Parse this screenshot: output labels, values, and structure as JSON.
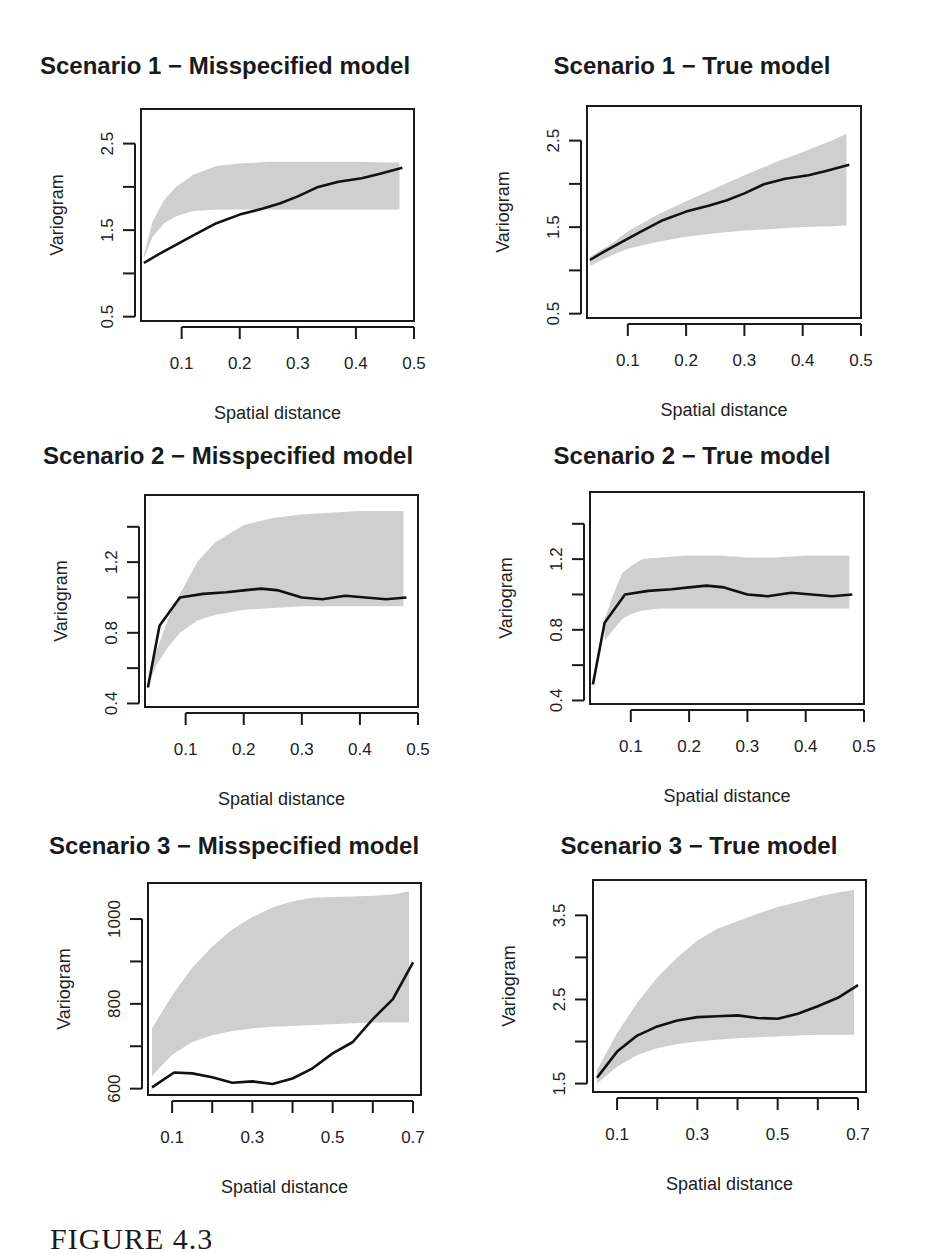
{
  "figure": {
    "caption": "FIGURE 4.3"
  },
  "chart_data": [
    {
      "type": "area",
      "title": "Scenario 1 − Misspecified model",
      "xlabel": "Spatial distance",
      "ylabel": "Variogram",
      "xlim": [
        0.03,
        0.5
      ],
      "ylim": [
        0.45,
        2.9
      ],
      "xticks": [
        0.1,
        0.2,
        0.3,
        0.4,
        0.5
      ],
      "xtick_labels": [
        "0.1",
        "0.2",
        "0.3",
        "0.4",
        "0.5"
      ],
      "yticks": [
        0.5,
        1.0,
        1.5,
        2.0,
        2.5
      ],
      "ytick_labels": [
        "0.5",
        "",
        "1.5",
        "",
        "2.5"
      ],
      "grid": false,
      "series": [
        {
          "name": "empirical variogram",
          "kind": "line",
          "x": [
            0.035,
            0.06,
            0.09,
            0.12,
            0.16,
            0.2,
            0.24,
            0.27,
            0.3,
            0.335,
            0.37,
            0.41,
            0.44,
            0.48
          ],
          "y": [
            1.12,
            1.22,
            1.33,
            1.44,
            1.58,
            1.68,
            1.75,
            1.81,
            1.89,
            2.0,
            2.06,
            2.1,
            2.15,
            2.22
          ]
        },
        {
          "name": "simulation envelope",
          "kind": "band",
          "x": [
            0.035,
            0.05,
            0.07,
            0.09,
            0.12,
            0.16,
            0.2,
            0.25,
            0.3,
            0.35,
            0.4,
            0.45,
            0.475
          ],
          "lower": [
            1.18,
            1.42,
            1.58,
            1.66,
            1.72,
            1.74,
            1.74,
            1.74,
            1.74,
            1.74,
            1.74,
            1.74,
            1.74
          ],
          "upper": [
            1.22,
            1.6,
            1.85,
            2.0,
            2.14,
            2.24,
            2.27,
            2.29,
            2.29,
            2.29,
            2.29,
            2.28,
            2.28
          ]
        }
      ]
    },
    {
      "type": "area",
      "title": "Scenario 1 − True model",
      "xlabel": "Spatial distance",
      "ylabel": "Variogram",
      "xlim": [
        0.03,
        0.5
      ],
      "ylim": [
        0.45,
        2.9
      ],
      "xticks": [
        0.1,
        0.2,
        0.3,
        0.4,
        0.5
      ],
      "xtick_labels": [
        "0.1",
        "0.2",
        "0.3",
        "0.4",
        "0.5"
      ],
      "yticks": [
        0.5,
        1.0,
        1.5,
        2.0,
        2.5
      ],
      "ytick_labels": [
        "0.5",
        "",
        "1.5",
        "",
        "2.5"
      ],
      "grid": false,
      "series": [
        {
          "name": "empirical variogram",
          "kind": "line",
          "x": [
            0.035,
            0.06,
            0.09,
            0.12,
            0.16,
            0.2,
            0.24,
            0.27,
            0.3,
            0.335,
            0.37,
            0.41,
            0.44,
            0.48
          ],
          "y": [
            1.12,
            1.22,
            1.33,
            1.44,
            1.58,
            1.68,
            1.75,
            1.81,
            1.89,
            2.0,
            2.06,
            2.1,
            2.15,
            2.22
          ]
        },
        {
          "name": "simulation envelope",
          "kind": "band",
          "x": [
            0.035,
            0.07,
            0.1,
            0.15,
            0.2,
            0.25,
            0.3,
            0.35,
            0.4,
            0.45,
            0.475
          ],
          "lower": [
            1.05,
            1.17,
            1.25,
            1.33,
            1.39,
            1.43,
            1.46,
            1.48,
            1.5,
            1.51,
            1.52
          ],
          "upper": [
            1.16,
            1.3,
            1.45,
            1.64,
            1.8,
            1.95,
            2.1,
            2.24,
            2.37,
            2.5,
            2.58
          ]
        }
      ]
    },
    {
      "type": "area",
      "title": "Scenario 2 − Misspecified model",
      "xlabel": "Spatial distance",
      "ylabel": "Variogram",
      "xlim": [
        0.03,
        0.5
      ],
      "ylim": [
        0.38,
        1.58
      ],
      "xticks": [
        0.1,
        0.2,
        0.3,
        0.4,
        0.5
      ],
      "xtick_labels": [
        "0.1",
        "0.2",
        "0.3",
        "0.4",
        "0.5"
      ],
      "yticks": [
        0.4,
        0.6,
        0.8,
        1.0,
        1.2,
        1.4
      ],
      "ytick_labels": [
        "0.4",
        "",
        "0.8",
        "",
        "1.2",
        ""
      ],
      "grid": false,
      "series": [
        {
          "name": "empirical variogram",
          "kind": "line",
          "x": [
            0.035,
            0.055,
            0.09,
            0.13,
            0.17,
            0.2,
            0.23,
            0.26,
            0.3,
            0.335,
            0.375,
            0.41,
            0.445,
            0.48
          ],
          "y": [
            0.49,
            0.84,
            1.0,
            1.02,
            1.03,
            1.04,
            1.05,
            1.04,
            1.0,
            0.99,
            1.01,
            1.0,
            0.99,
            1.0
          ]
        },
        {
          "name": "simulation envelope",
          "kind": "band",
          "x": [
            0.035,
            0.05,
            0.07,
            0.09,
            0.12,
            0.15,
            0.2,
            0.25,
            0.3,
            0.35,
            0.4,
            0.45,
            0.475
          ],
          "lower": [
            0.5,
            0.62,
            0.72,
            0.8,
            0.87,
            0.9,
            0.93,
            0.94,
            0.95,
            0.95,
            0.95,
            0.95,
            0.95
          ],
          "upper": [
            0.52,
            0.7,
            0.88,
            1.02,
            1.2,
            1.31,
            1.41,
            1.45,
            1.47,
            1.48,
            1.49,
            1.49,
            1.49
          ]
        }
      ]
    },
    {
      "type": "area",
      "title": "Scenario 2 − True model",
      "xlabel": "Spatial distance",
      "ylabel": "Variogram",
      "xlim": [
        0.03,
        0.5
      ],
      "ylim": [
        0.38,
        1.58
      ],
      "xticks": [
        0.1,
        0.2,
        0.3,
        0.4,
        0.5
      ],
      "xtick_labels": [
        "0.1",
        "0.2",
        "0.3",
        "0.4",
        "0.5"
      ],
      "yticks": [
        0.4,
        0.6,
        0.8,
        1.0,
        1.2,
        1.4
      ],
      "ytick_labels": [
        "0.4",
        "",
        "0.8",
        "",
        "1.2",
        ""
      ],
      "grid": false,
      "series": [
        {
          "name": "empirical variogram",
          "kind": "line",
          "x": [
            0.035,
            0.055,
            0.09,
            0.13,
            0.17,
            0.2,
            0.23,
            0.26,
            0.3,
            0.335,
            0.375,
            0.41,
            0.445,
            0.48
          ],
          "y": [
            0.49,
            0.84,
            1.0,
            1.02,
            1.03,
            1.04,
            1.05,
            1.04,
            1.0,
            0.99,
            1.01,
            1.0,
            0.99,
            1.0
          ]
        },
        {
          "name": "simulation envelope",
          "kind": "band",
          "x": [
            0.055,
            0.07,
            0.085,
            0.1,
            0.12,
            0.15,
            0.2,
            0.25,
            0.3,
            0.35,
            0.4,
            0.45,
            0.475
          ],
          "lower": [
            0.74,
            0.8,
            0.86,
            0.89,
            0.91,
            0.92,
            0.92,
            0.92,
            0.92,
            0.92,
            0.92,
            0.92,
            0.92
          ],
          "upper": [
            0.86,
            1.0,
            1.12,
            1.16,
            1.2,
            1.21,
            1.22,
            1.22,
            1.21,
            1.21,
            1.22,
            1.22,
            1.22
          ]
        }
      ]
    },
    {
      "type": "area",
      "title": "Scenario 3 − Misspecified model",
      "xlabel": "Spatial distance",
      "ylabel": "Variogram",
      "xlim": [
        0.04,
        0.72
      ],
      "ylim": [
        585,
        1085
      ],
      "xticks": [
        0.1,
        0.2,
        0.3,
        0.4,
        0.5,
        0.6,
        0.7
      ],
      "xtick_labels": [
        "0.1",
        "",
        "0.3",
        "",
        "0.5",
        "",
        "0.7"
      ],
      "yticks": [
        600,
        700,
        800,
        900,
        1000
      ],
      "ytick_labels": [
        "600",
        "",
        "800",
        "",
        "1000"
      ],
      "grid": false,
      "series": [
        {
          "name": "empirical variogram",
          "kind": "line",
          "x": [
            0.05,
            0.105,
            0.15,
            0.2,
            0.25,
            0.3,
            0.35,
            0.4,
            0.45,
            0.5,
            0.55,
            0.6,
            0.65,
            0.7
          ],
          "y": [
            603,
            638,
            636,
            627,
            614,
            617,
            611,
            624,
            648,
            683,
            710,
            764,
            811,
            898
          ]
        },
        {
          "name": "simulation envelope",
          "kind": "band",
          "x": [
            0.05,
            0.1,
            0.15,
            0.2,
            0.25,
            0.3,
            0.35,
            0.4,
            0.45,
            0.5,
            0.55,
            0.6,
            0.65,
            0.69
          ],
          "lower": [
            630,
            680,
            710,
            726,
            736,
            742,
            746,
            748,
            750,
            752,
            754,
            756,
            756,
            756
          ],
          "upper": [
            742,
            820,
            885,
            935,
            975,
            1005,
            1027,
            1042,
            1050,
            1052,
            1053,
            1055,
            1058,
            1065
          ]
        }
      ]
    },
    {
      "type": "area",
      "title": "Scenario 3 − True model",
      "xlabel": "Spatial distance",
      "ylabel": "Variogram",
      "xlim": [
        0.04,
        0.72
      ],
      "ylim": [
        1.4,
        3.92
      ],
      "xticks": [
        0.1,
        0.2,
        0.3,
        0.4,
        0.5,
        0.6,
        0.7
      ],
      "xtick_labels": [
        "0.1",
        "",
        "0.3",
        "",
        "0.5",
        "",
        "0.7"
      ],
      "yticks": [
        1.5,
        2.0,
        2.5,
        3.0,
        3.5
      ],
      "ytick_labels": [
        "1.5",
        "",
        "2.5",
        "",
        "3.5"
      ],
      "grid": false,
      "series": [
        {
          "name": "empirical variogram",
          "kind": "line",
          "x": [
            0.05,
            0.1,
            0.15,
            0.2,
            0.25,
            0.3,
            0.35,
            0.4,
            0.45,
            0.5,
            0.55,
            0.6,
            0.65,
            0.7
          ],
          "y": [
            1.57,
            1.88,
            2.07,
            2.18,
            2.25,
            2.29,
            2.3,
            2.31,
            2.28,
            2.27,
            2.33,
            2.42,
            2.52,
            2.67
          ]
        },
        {
          "name": "simulation envelope",
          "kind": "band",
          "x": [
            0.05,
            0.1,
            0.15,
            0.2,
            0.25,
            0.3,
            0.35,
            0.4,
            0.45,
            0.5,
            0.55,
            0.6,
            0.65,
            0.69
          ],
          "lower": [
            1.5,
            1.7,
            1.84,
            1.92,
            1.97,
            2.0,
            2.02,
            2.04,
            2.05,
            2.06,
            2.07,
            2.08,
            2.08,
            2.08
          ],
          "upper": [
            1.66,
            2.1,
            2.46,
            2.76,
            3.0,
            3.2,
            3.34,
            3.43,
            3.52,
            3.6,
            3.66,
            3.72,
            3.77,
            3.8
          ]
        }
      ]
    }
  ],
  "layout_panels": [
    {
      "left": 0,
      "top": 40,
      "box": [
        141,
        69,
        414,
        281
      ],
      "title_x": 225
    },
    {
      "left": 463,
      "top": 40,
      "box": [
        124,
        66,
        398,
        278
      ],
      "title_x": 225
    },
    {
      "left": 0,
      "top": 430,
      "box": [
        145,
        65,
        418,
        277
      ],
      "title_x": 228
    },
    {
      "left": 463,
      "top": 430,
      "box": [
        127,
        62,
        401,
        274
      ],
      "title_x": 225
    },
    {
      "left": 0,
      "top": 820,
      "box": [
        148,
        63,
        421,
        275
      ],
      "title_x": 234
    },
    {
      "left": 463,
      "top": 820,
      "box": [
        130,
        60,
        403,
        272
      ],
      "title_x": 232
    }
  ]
}
